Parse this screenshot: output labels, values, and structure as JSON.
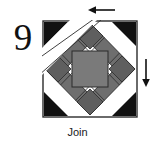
{
  "step": {
    "number": "9",
    "caption": "Join"
  },
  "arrows": [
    {
      "name": "arrow-left-top",
      "direction": "left",
      "position": "top"
    },
    {
      "name": "arrow-down-right",
      "direction": "down",
      "position": "right"
    }
  ],
  "colors": {
    "dark": "#111111",
    "medium_gray": "#6e6e6e",
    "light_gray": "#8f8f8f",
    "background": "#ffffff",
    "outline": "#2b2b2b",
    "off_white": "#f2f2f2"
  },
  "block": {
    "name": "quilt-block",
    "shape": "square",
    "corner_units": [
      {
        "position": "top-left",
        "type": "half-square-triangle",
        "triangle_color": "#111111",
        "background_color": "#ffffff"
      },
      {
        "position": "top-right",
        "type": "half-square-triangle",
        "triangle_color": "#111111",
        "background_color": "#ffffff"
      },
      {
        "position": "bottom-left",
        "type": "half-square-triangle",
        "triangle_color": "#111111",
        "background_color": "#ffffff"
      },
      {
        "position": "bottom-right",
        "type": "half-square-triangle",
        "triangle_color": "#111111",
        "background_color": "#ffffff"
      }
    ],
    "edge_units": [
      {
        "position": "top",
        "type": "diamond",
        "color": "#6e6e6e"
      },
      {
        "position": "right",
        "type": "diamond",
        "color": "#6e6e6e"
      },
      {
        "position": "bottom",
        "type": "diamond",
        "color": "#6e6e6e"
      },
      {
        "position": "left",
        "type": "diamond",
        "color": "#6e6e6e"
      }
    ],
    "ring": {
      "type": "diamond-ring",
      "color": "#6e6e6e",
      "segments": 12
    },
    "center": {
      "type": "square-on-point",
      "color": "#7a7a7a"
    },
    "seam_line": {
      "type": "diagonal-seam-overlay",
      "corner": "top-left",
      "color": "#ffffff"
    }
  }
}
